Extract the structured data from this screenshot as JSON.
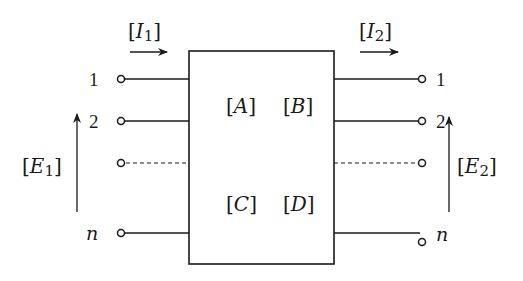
{
  "diagram": {
    "type": "n-port network (ABCD matrix block)",
    "block": {
      "matrix_labels": {
        "top_left": "A",
        "top_right": "B",
        "bottom_left": "C",
        "bottom_right": "D"
      }
    },
    "input_side": {
      "current_label": {
        "symbol": "I",
        "subscript": "1"
      },
      "voltage_label": {
        "symbol": "E",
        "subscript": "1"
      },
      "terminals": [
        {
          "label": "1",
          "style": "solid"
        },
        {
          "label": "2",
          "style": "solid"
        },
        {
          "label": "",
          "style": "dashed"
        },
        {
          "label": "n",
          "style": "solid"
        }
      ]
    },
    "output_side": {
      "current_label": {
        "symbol": "I",
        "subscript": "2"
      },
      "voltage_label": {
        "symbol": "E",
        "subscript": "2"
      },
      "terminals": [
        {
          "label": "1",
          "style": "solid"
        },
        {
          "label": "2",
          "style": "solid"
        },
        {
          "label": "",
          "style": "dashed"
        },
        {
          "label": "n",
          "style": "solid"
        }
      ]
    },
    "colors": {
      "stroke": "#1a1a1a",
      "background": "#ffffff"
    }
  }
}
